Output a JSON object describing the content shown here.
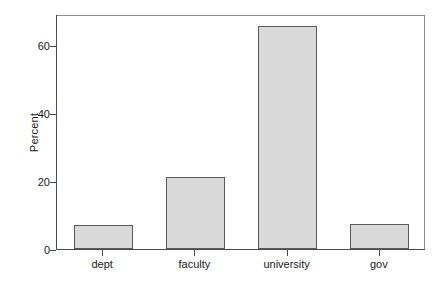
{
  "chart_data": {
    "type": "bar",
    "title": "",
    "subtitle": "",
    "xlabel": "",
    "ylabel": "Percent",
    "categories": [
      "dept",
      "faculty",
      "university",
      "gov"
    ],
    "values": [
      7,
      21,
      65.5,
      7.3
    ],
    "series": [
      {
        "name": "Percent",
        "values": [
          7,
          21,
          65.5,
          7.3
        ]
      }
    ],
    "ylim": [
      0,
      69
    ],
    "xlim": [
      0,
      4
    ],
    "ytick_labels": [
      "0",
      "20",
      "40",
      "60"
    ],
    "ytick_values": [
      0,
      20,
      40,
      60
    ],
    "grid": false,
    "legend": false,
    "legend_position": "none",
    "annotations": [],
    "bar_fill_color": "#d9d9d9",
    "bar_border_color": "#5a5a5a",
    "axis_color": "#4d4d4d",
    "frame_color": "#8c8c8c",
    "background_color": "#ffffff",
    "text_color": "#1a1a1a"
  }
}
